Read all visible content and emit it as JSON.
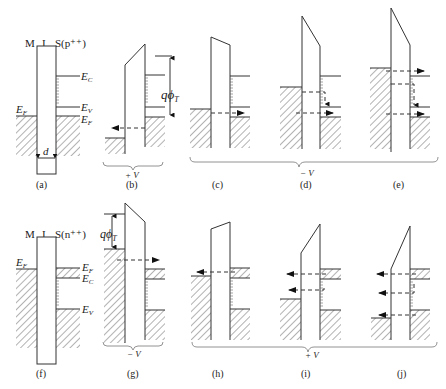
{
  "figure": {
    "top_row": {
      "header": {
        "m": "M",
        "i": "I",
        "s": "S(p⁺⁺)"
      },
      "labels": {
        "ec": "E",
        "ec_sub": "C",
        "ev": "E",
        "ev_sub": "V",
        "ef_s": "E",
        "ef_s_sub": "F",
        "ef_m": "E",
        "ef_m_sub": "F",
        "d": "d",
        "q_phi": "qϕ",
        "q_phi_sub": "T"
      },
      "panels": [
        "(a)",
        "(b)",
        "(c)",
        "(d)",
        "(e)"
      ],
      "bias_labels": {
        "b": "+ V",
        "cde": "− V"
      }
    },
    "bottom_row": {
      "header": {
        "m": "M",
        "i": "I",
        "s": "S(n⁺⁺)"
      },
      "labels": {
        "ef_m": "E",
        "ef_m_sub": "F",
        "ef_s": "E",
        "ef_s_sub": "F",
        "ec": "E",
        "ec_sub": "C",
        "ev": "E",
        "ev_sub": "V",
        "q_phi": "qϕ",
        "q_phi_sub": "T"
      },
      "panels": [
        "(f)",
        "(g)",
        "(h)",
        "(i)",
        "(j)"
      ],
      "bias_labels": {
        "g": "− V",
        "hij": "+ V"
      }
    }
  }
}
